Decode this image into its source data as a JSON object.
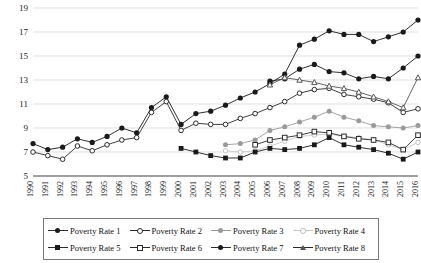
{
  "chart_data": {
    "type": "line",
    "title": "",
    "xlabel": "",
    "ylabel": "",
    "ylim": [
      5,
      19
    ],
    "yticks": [
      5,
      7,
      9,
      11,
      13,
      15,
      17,
      19
    ],
    "grid": true,
    "legend_position": "bottom",
    "categories": [
      "1990",
      "1991",
      "1992",
      "1993",
      "1994",
      "1995",
      "1996",
      "1997",
      "1998",
      "1999",
      "2000",
      "2001",
      "2002",
      "2003",
      "2004",
      "2005",
      "2006",
      "2007",
      "2008",
      "2009",
      "2010",
      "2011",
      "2012",
      "2013",
      "2014",
      "2015",
      "2016"
    ],
    "series": [
      {
        "name": "Poverty Rate 1",
        "marker": "filled-circle",
        "color": "#1a1a1a",
        "values": [
          7.7,
          7.2,
          7.4,
          8.1,
          7.8,
          8.3,
          9.0,
          8.6,
          10.7,
          11.6,
          9.3,
          10.2,
          10.4,
          10.9,
          11.5,
          12.0,
          12.7,
          13.5,
          15.9,
          16.4,
          17.1,
          16.8,
          16.8,
          16.2,
          16.6,
          17.0,
          18.0
        ]
      },
      {
        "name": "Poverty Rate 2",
        "marker": "open-circle",
        "color": "#2b2b2b",
        "values": [
          7.0,
          6.7,
          6.4,
          7.5,
          7.1,
          7.6,
          8.0,
          8.2,
          10.3,
          11.2,
          8.8,
          9.4,
          9.3,
          9.3,
          9.8,
          10.2,
          10.7,
          11.2,
          11.9,
          12.2,
          12.3,
          11.8,
          11.6,
          11.4,
          11.1,
          10.3,
          10.6
        ]
      },
      {
        "name": "Poverty Rate 3",
        "marker": "filled-circle-gray",
        "color": "#9a9a9a",
        "values": [
          null,
          null,
          null,
          null,
          null,
          null,
          null,
          null,
          null,
          null,
          null,
          null,
          null,
          7.6,
          7.7,
          8.0,
          8.8,
          9.1,
          9.5,
          9.9,
          10.4,
          9.9,
          9.6,
          9.2,
          9.1,
          9.0,
          9.2
        ]
      },
      {
        "name": "Poverty Rate 4",
        "marker": "open-circle-light",
        "color": "#c8c8c8",
        "values": [
          null,
          null,
          null,
          null,
          null,
          null,
          null,
          null,
          null,
          null,
          null,
          null,
          null,
          7.1,
          7.0,
          7.1,
          7.5,
          7.9,
          8.3,
          8.4,
          8.5,
          8.3,
          8.2,
          8.0,
          7.6,
          7.2,
          7.8
        ]
      },
      {
        "name": "Poverty Rate 5",
        "marker": "filled-square",
        "color": "#1a1a1a",
        "values": [
          null,
          null,
          null,
          null,
          null,
          null,
          null,
          null,
          null,
          null,
          7.3,
          7.0,
          6.7,
          6.5,
          6.5,
          7.0,
          7.3,
          7.2,
          7.3,
          7.6,
          8.2,
          7.6,
          7.4,
          7.2,
          6.9,
          6.4,
          7.0
        ]
      },
      {
        "name": "Poverty Rate 6",
        "marker": "open-square",
        "color": "#2b2b2b",
        "values": [
          null,
          null,
          null,
          null,
          null,
          null,
          null,
          null,
          null,
          null,
          null,
          null,
          null,
          null,
          null,
          7.6,
          8.0,
          8.2,
          8.4,
          8.7,
          8.6,
          8.3,
          8.1,
          8.0,
          7.8,
          7.2,
          8.4
        ]
      },
      {
        "name": "Poverty Rate 7",
        "marker": "filled-circle",
        "color": "#1a1a1a",
        "values": [
          null,
          null,
          null,
          null,
          null,
          null,
          null,
          null,
          null,
          null,
          null,
          null,
          null,
          null,
          null,
          null,
          12.9,
          13.1,
          13.9,
          14.3,
          13.7,
          13.6,
          13.1,
          13.3,
          13.1,
          14.0,
          15.0
        ]
      },
      {
        "name": "Poverty Rate 8",
        "marker": "open-triangle",
        "color": "#555555",
        "values": [
          null,
          null,
          null,
          null,
          null,
          null,
          null,
          null,
          null,
          null,
          null,
          null,
          null,
          null,
          null,
          null,
          12.6,
          13.2,
          13.0,
          12.8,
          12.5,
          12.3,
          12.0,
          11.6,
          11.2,
          10.7,
          13.2
        ]
      }
    ]
  },
  "legend": {
    "rows": [
      [
        {
          "label": "Poverty Rate 1",
          "symbol": "filled-circle"
        },
        {
          "label": "Poverty Rate 2",
          "symbol": "open-circle"
        },
        {
          "label": "Poverty Rate 3",
          "symbol": "filled-circle-gray"
        },
        {
          "label": "Poverty Rate 4",
          "symbol": "open-circle-light"
        }
      ],
      [
        {
          "label": "Poverty Rate 5",
          "symbol": "filled-square"
        },
        {
          "label": "Poverty Rate 6",
          "symbol": "open-square"
        },
        {
          "label": "Poverty Rate 7",
          "symbol": "filled-circle"
        },
        {
          "label": "Poverty Rate 8",
          "symbol": "open-triangle"
        }
      ]
    ]
  }
}
